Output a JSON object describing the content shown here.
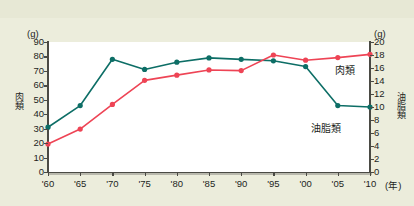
{
  "figure": {
    "background_color": "#eceddc",
    "plot_background_color": "#ffffff"
  },
  "axes": {
    "left": {
      "unit": "(g)",
      "title": "肉類",
      "ticks": [
        "90",
        "80",
        "70",
        "60",
        "50",
        "40",
        "30",
        "20",
        "10",
        "0"
      ],
      "min": 0,
      "max": 90
    },
    "right": {
      "unit": "(g)",
      "title": "油脂類",
      "ticks": [
        "20",
        "18",
        "16",
        "14",
        "12",
        "10",
        "8",
        "6",
        "4",
        "2",
        "0"
      ],
      "min": 0,
      "max": 20
    },
    "x": {
      "unit": "(年)",
      "ticks": [
        "'60",
        "'65",
        "'70",
        "'75",
        "'80",
        "'85",
        "'90",
        "'95",
        "'00",
        "'05",
        "'10"
      ]
    }
  },
  "legend": {
    "meat_label": "肉類",
    "fat_label": "油脂類"
  },
  "colors": {
    "meat": "#ee4455",
    "fat": "#0d6e66",
    "axis": "#4a4a44",
    "text": "#231f1c"
  },
  "chart_data": {
    "type": "line",
    "title": "",
    "xlabel": "(年)",
    "ylabel": "肉類 (g)",
    "categories": [
      "'60",
      "'65",
      "'70",
      "'75",
      "'80",
      "'85",
      "'90",
      "'95",
      "'00",
      "'05",
      "'10"
    ],
    "grid": false,
    "legend_position": "inline-right",
    "series": [
      {
        "name": "肉類",
        "axis": "left",
        "unit": "g",
        "color": "#0d6e66",
        "ylim": [
          0,
          90
        ],
        "values": [
          31,
          46,
          78,
          71,
          76,
          79,
          78,
          77,
          73,
          46,
          45
        ]
      },
      {
        "name": "油脂類",
        "axis": "right",
        "unit": "g",
        "color": "#ee4455",
        "ylim": [
          0,
          20
        ],
        "values": [
          4.3,
          6.6,
          10.4,
          14.1,
          14.9,
          15.7,
          15.6,
          18.0,
          17.2,
          17.6,
          18.1
        ]
      }
    ]
  }
}
